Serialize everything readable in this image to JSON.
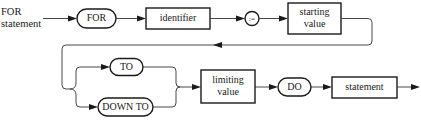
{
  "diagram": {
    "type": "syntax-diagram",
    "title_line1": "FOR",
    "title_line2": "statement",
    "nodes": [
      {
        "id": "for",
        "kind": "terminal",
        "label": "FOR"
      },
      {
        "id": "identifier",
        "kind": "nonterminal",
        "label": "identifier"
      },
      {
        "id": "assign",
        "kind": "terminal-circle",
        "label": ":="
      },
      {
        "id": "starting_value",
        "kind": "nonterminal",
        "label_line1": "starting",
        "label_line2": "value"
      },
      {
        "id": "to",
        "kind": "terminal",
        "label": "TO"
      },
      {
        "id": "down_to",
        "kind": "terminal",
        "label": "DOWN TO"
      },
      {
        "id": "limiting_value",
        "kind": "nonterminal",
        "label_line1": "limiting",
        "label_line2": "value"
      },
      {
        "id": "do",
        "kind": "terminal",
        "label": "DO"
      },
      {
        "id": "statement",
        "kind": "nonterminal",
        "label": "statement"
      }
    ],
    "edges": [
      [
        "start",
        "for"
      ],
      [
        "for",
        "identifier"
      ],
      [
        "identifier",
        "assign"
      ],
      [
        "assign",
        "starting_value"
      ],
      [
        "starting_value",
        "to"
      ],
      [
        "starting_value",
        "down_to"
      ],
      [
        "to",
        "limiting_value"
      ],
      [
        "down_to",
        "limiting_value"
      ],
      [
        "limiting_value",
        "do"
      ],
      [
        "do",
        "statement"
      ],
      [
        "statement",
        "end"
      ]
    ],
    "colors": {
      "stroke": "#1a1a1a",
      "background": "#ffffff"
    }
  }
}
